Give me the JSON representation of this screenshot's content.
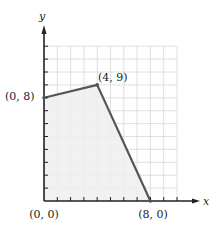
{
  "chart_data": {
    "type": "area",
    "title": "",
    "xlabel": "x",
    "ylabel": "y",
    "xlim": [
      0,
      10
    ],
    "ylim": [
      0,
      12
    ],
    "grid": true,
    "polygon": [
      {
        "x": 0,
        "y": 0,
        "label": "(0, 0)"
      },
      {
        "x": 0,
        "y": 8,
        "label": "(0, 8)"
      },
      {
        "x": 4,
        "y": 9,
        "label": "(4, 9)"
      },
      {
        "x": 8,
        "y": 0,
        "label": "(8, 0)"
      }
    ],
    "shaded_region": true,
    "colors": {
      "boundary": "#555555",
      "fill": "#efefef",
      "grid": "#d8d8d8",
      "axis": "#222222"
    }
  },
  "labels": {
    "x_axis": "x",
    "y_axis": "y",
    "p0": "(0, 0)",
    "p1": "(0, 8)",
    "p2": "(4, 9)",
    "p3": "(8, 0)"
  }
}
